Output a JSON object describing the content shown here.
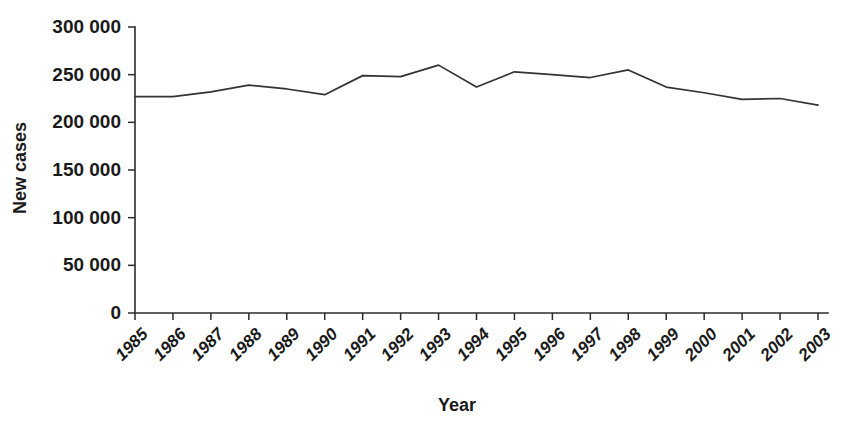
{
  "chart_data": {
    "type": "line",
    "title": "",
    "xlabel": "Year",
    "ylabel": "New cases",
    "categories": [
      "1985",
      "1986",
      "1987",
      "1988",
      "1989",
      "1990",
      "1991",
      "1992",
      "1993",
      "1994",
      "1995",
      "1996",
      "1997",
      "1998",
      "1999",
      "2000",
      "2001",
      "2002",
      "2003"
    ],
    "values": [
      227000,
      227000,
      232000,
      239000,
      235000,
      229000,
      249000,
      248000,
      260000,
      237000,
      253000,
      250000,
      247000,
      255000,
      237000,
      231000,
      224000,
      225000,
      218000
    ],
    "ylim": [
      0,
      300000
    ],
    "yticks": [
      0,
      50000,
      100000,
      150000,
      200000,
      250000,
      300000
    ],
    "ytick_labels": [
      "0",
      "50 000",
      "100 000",
      "150 000",
      "200 000",
      "250 000",
      "300 000"
    ],
    "grid": false,
    "legend": false,
    "legend_position": "none",
    "series_color": "#333333",
    "axis_color": "#2b2b2b",
    "background_color": "#ffffff"
  },
  "axes": {
    "x_title": "Year",
    "y_title": "New cases"
  }
}
